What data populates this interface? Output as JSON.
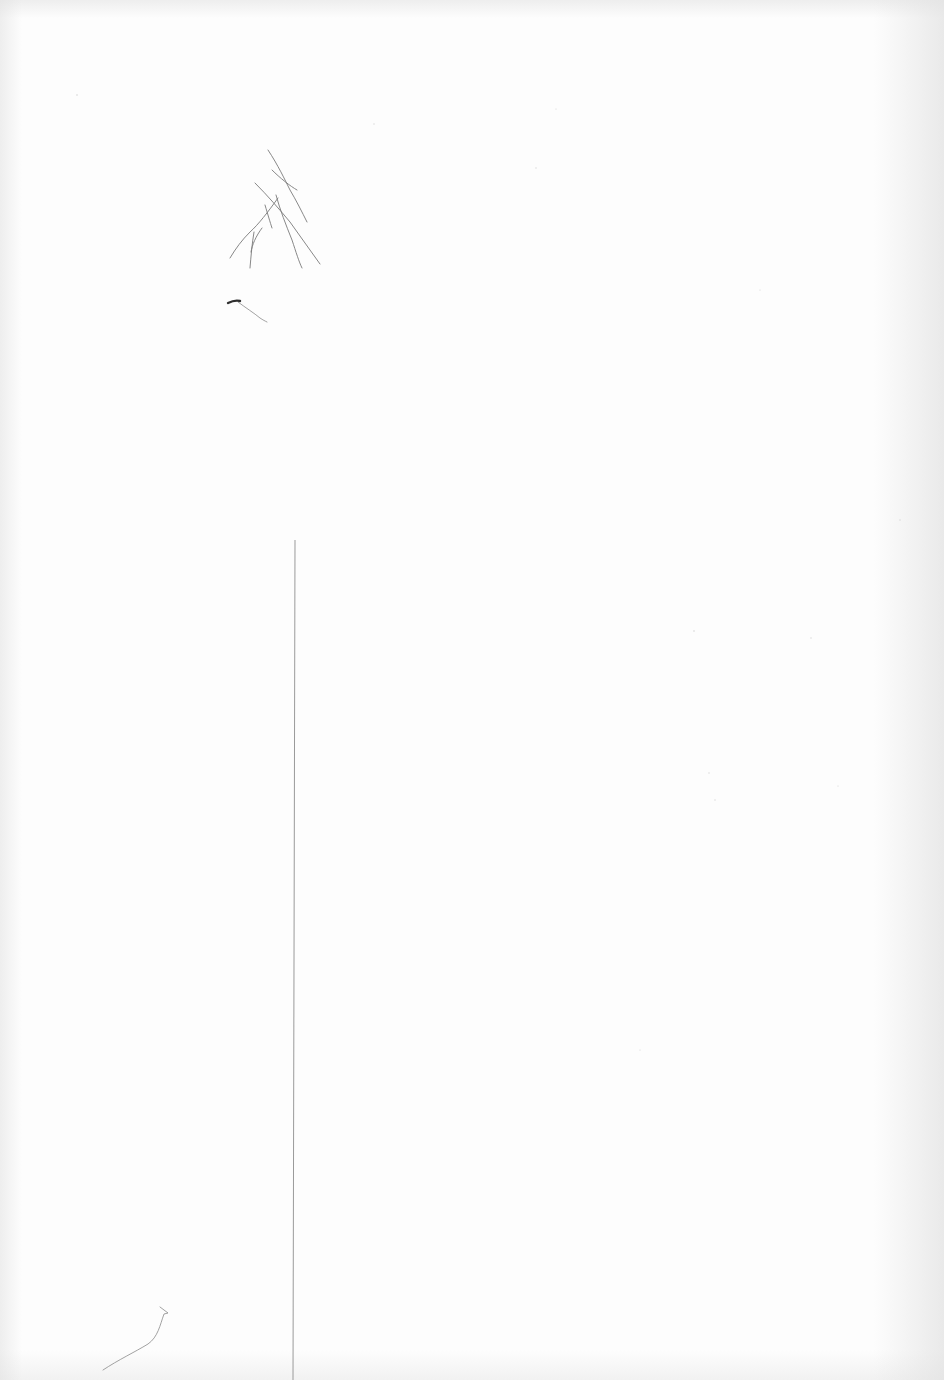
{
  "page": {
    "type": "scanned-blank-paper",
    "background_color": "#fdfdfd",
    "mark_color": "#6f6f6f",
    "line_color": "#9a9a9a"
  },
  "vertical_line": {
    "x": 294,
    "y_start": 540,
    "y_end": 1380
  },
  "fibers": [
    "top-left-fiber-cluster",
    "small-dark-fleck",
    "bottom-left-curved-fiber"
  ]
}
